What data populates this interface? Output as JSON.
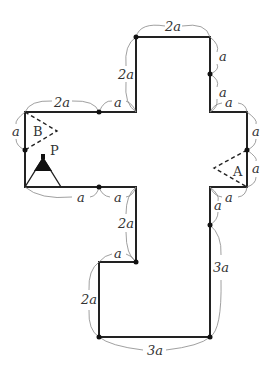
{
  "figure": {
    "type": "cross-shaped polygon with dimension labels",
    "unit": "a",
    "points": {
      "P": "P",
      "A": "A",
      "B": "B"
    },
    "dimensions": {
      "top_edge": "2a",
      "top_right_upper": "a",
      "top_right_lower": "a",
      "top_left_vertical": "2a",
      "left_arm_top_long": "2a",
      "left_arm_top_short": "a",
      "right_arm_top": "a",
      "right_arm_right_upper": "a",
      "right_arm_right_lower": "a",
      "left_arm_left": "a",
      "left_arm_bottom_left": "a",
      "left_arm_bottom_right": "a",
      "right_arm_bottom": "a",
      "lower_left_inner_vertical": "2a",
      "lower_step_horizontal": "a",
      "lower_left_vertical": "2a",
      "lower_right_upper": "a",
      "lower_right_vertical": "3a",
      "bottom_edge": "3a"
    }
  }
}
